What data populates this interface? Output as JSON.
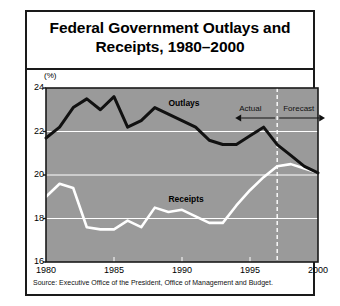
{
  "figure": {
    "title_line1": "Federal Government Outlays and",
    "title_line2": "Receipts, 1980–2000",
    "unit_label": "(%)",
    "source": "Source: Executive Office of the President, Office of Management and Budget."
  },
  "annotations": {
    "actual": "Actual",
    "forecast": "Forecast",
    "outlays_label": "Outlays",
    "receipts_label": "Receipts"
  },
  "colors": {
    "plot_background": "#9a9a9a",
    "gridline": "#ffffff",
    "outlays_line": "#111111",
    "receipts_line": "#ffffff",
    "frame": "#1a1a1a",
    "page_background": "#ffffff"
  },
  "chart_data": {
    "type": "line",
    "title": "Federal Government Outlays and Receipts, 1980–2000",
    "xlabel": "",
    "ylabel": "(%)",
    "ylim": [
      16,
      24
    ],
    "xlim": [
      1980,
      2000
    ],
    "yticks": [
      16,
      18,
      20,
      22,
      24
    ],
    "xticks": [
      1980,
      1985,
      1990,
      1995,
      2000
    ],
    "grid": true,
    "legend": "inline-labels",
    "divider_year": 1997,
    "divider_style": "dashed-white",
    "x": [
      1980,
      1981,
      1982,
      1983,
      1984,
      1985,
      1986,
      1987,
      1988,
      1989,
      1990,
      1991,
      1992,
      1993,
      1994,
      1995,
      1996,
      1997,
      1998,
      1999,
      2000
    ],
    "series": [
      {
        "name": "Outlays",
        "color": "#111111",
        "values": [
          21.7,
          22.2,
          23.1,
          23.5,
          23.0,
          23.6,
          22.2,
          22.5,
          23.1,
          22.8,
          22.5,
          22.2,
          21.6,
          21.4,
          21.4,
          21.8,
          22.2,
          21.4,
          20.9,
          20.4,
          20.1
        ]
      },
      {
        "name": "Receipts",
        "color": "#ffffff",
        "values": [
          19.0,
          19.6,
          19.4,
          17.6,
          17.5,
          17.5,
          17.9,
          17.6,
          18.5,
          18.3,
          18.4,
          18.1,
          17.8,
          17.8,
          18.6,
          19.3,
          19.9,
          20.4,
          20.5,
          20.3,
          20.1
        ]
      }
    ],
    "annotations": [
      {
        "text": "Outlays",
        "x": 1989,
        "y": 23.3
      },
      {
        "text": "Receipts",
        "x": 1989,
        "y": 18.9
      },
      {
        "text": "Actual",
        "x": 1994.5,
        "y": 23.6
      },
      {
        "text": "Forecast",
        "x": 1998.8,
        "y": 23.6
      }
    ]
  }
}
